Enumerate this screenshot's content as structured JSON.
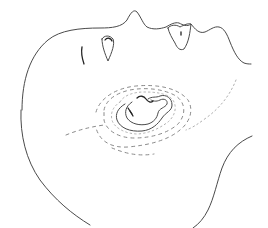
{
  "illustration": {
    "subject": "line drawing of head in profile (supine) with ear and dashed surgical marking outlines",
    "colors": {
      "background": "#ffffff",
      "line": "#4a4a4a",
      "line_dark": "#222222",
      "dashed": "#8a8a8a",
      "dotted": "#b0b0b0"
    },
    "parts": [
      {
        "name": "head-profile-contour",
        "style": "solid"
      },
      {
        "name": "face-lower-contour",
        "style": "solid"
      },
      {
        "name": "jaw-contour",
        "style": "solid"
      },
      {
        "name": "eye-mark",
        "style": "solid"
      },
      {
        "name": "nostril-left",
        "style": "solid"
      },
      {
        "name": "nostril-right",
        "style": "solid"
      },
      {
        "name": "ear-outer",
        "style": "solid"
      },
      {
        "name": "ear-inner",
        "style": "solid"
      },
      {
        "name": "marking-inner-dotted",
        "style": "dotted"
      },
      {
        "name": "marking-middle-dashed",
        "style": "dashed"
      },
      {
        "name": "marking-outer-dashed",
        "style": "dashed"
      },
      {
        "name": "marking-incision-left",
        "style": "dashed"
      },
      {
        "name": "marking-incision-right",
        "style": "dotted"
      }
    ]
  }
}
